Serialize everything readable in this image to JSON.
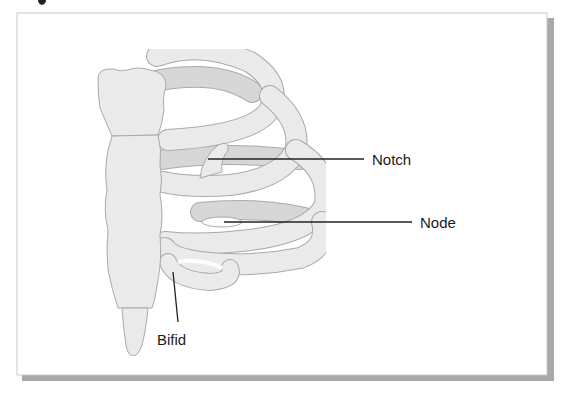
{
  "figure": {
    "title_fragment": "",
    "panel": {
      "background": "#ffffff",
      "border": "#c8c8c8",
      "shadow": "#9a9a9a"
    },
    "colors": {
      "bone_light": "#ececec",
      "bone_dark": "#d8d8d8",
      "bone_outline": "#a9a9a9",
      "leader": "#222222",
      "text": "#1a1a1a"
    }
  },
  "labels": [
    {
      "id": "notch",
      "text": "Notch"
    },
    {
      "id": "node",
      "text": "Node"
    },
    {
      "id": "bifid",
      "text": "Bifid"
    }
  ],
  "structures": {
    "sternum": "sternum",
    "ribs": [
      "rib-1",
      "rib-2",
      "rib-3",
      "rib-4",
      "rib-5"
    ]
  }
}
